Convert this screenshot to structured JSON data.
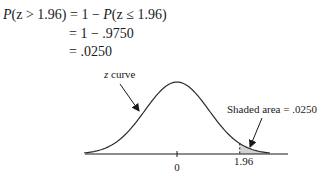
{
  "equations": {
    "line1_lhs_fn": "P",
    "line1_lhs_arg": "(z > 1.96)",
    "line1_rhs": " = 1 − ",
    "line1_rhs_fn": "P",
    "line1_rhs_arg": "(z ≤ 1.96)",
    "line2": "= 1 − .9750",
    "line3": "= .0250"
  },
  "diagram": {
    "curve_label_var": "z",
    "curve_label_rest": " curve",
    "shaded_label": "Shaded area = .0250",
    "tick_zero": "0",
    "tick_critical": "1.96",
    "critical_value": 1.96,
    "shaded_area": 0.025,
    "colors": {
      "curve": "#2a2a2a",
      "shade": "#d3d3d3",
      "axis": "#1a1a1a"
    }
  }
}
